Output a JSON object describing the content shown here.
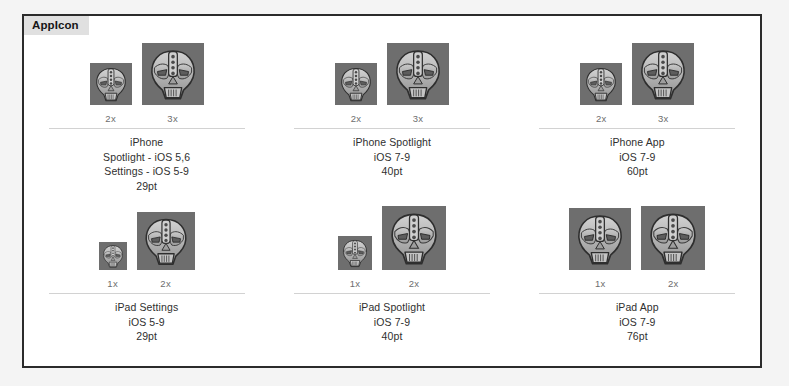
{
  "panel": {
    "tab_label": "AppIcon",
    "border_color": "#2b2b2b",
    "tab_bg": "#e0e0e0",
    "background": "#ffffff"
  },
  "icon": {
    "name": "app-icon-mask-artwork",
    "background_color": "#6e6e6e",
    "fill_color": "#b5b5b5",
    "outline_color": "#2e2e2e"
  },
  "groups": [
    {
      "id": "iphone-spotlight-settings",
      "title": "iPhone",
      "line2": "Spotlight - iOS 5,6",
      "line3": "Settings - iOS 5-9",
      "size": "29pt",
      "slots": [
        {
          "scale": "2x",
          "px": 42
        },
        {
          "scale": "3x",
          "px": 62
        }
      ]
    },
    {
      "id": "iphone-spotlight",
      "title": "iPhone Spotlight",
      "line2": "iOS 7-9",
      "line3": "",
      "size": "40pt",
      "slots": [
        {
          "scale": "2x",
          "px": 42
        },
        {
          "scale": "3x",
          "px": 62
        }
      ]
    },
    {
      "id": "iphone-app",
      "title": "iPhone App",
      "line2": "iOS 7-9",
      "line3": "",
      "size": "60pt",
      "slots": [
        {
          "scale": "2x",
          "px": 42
        },
        {
          "scale": "3x",
          "px": 62
        }
      ]
    },
    {
      "id": "ipad-settings",
      "title": "iPad Settings",
      "line2": "iOS 5-9",
      "line3": "",
      "size": "29pt",
      "slots": [
        {
          "scale": "1x",
          "px": 28
        },
        {
          "scale": "2x",
          "px": 58
        }
      ]
    },
    {
      "id": "ipad-spotlight",
      "title": "iPad Spotlight",
      "line2": "iOS 7-9",
      "line3": "",
      "size": "40pt",
      "slots": [
        {
          "scale": "1x",
          "px": 34
        },
        {
          "scale": "2x",
          "px": 64
        }
      ]
    },
    {
      "id": "ipad-app",
      "title": "iPad App",
      "line2": "iOS 7-9",
      "line3": "",
      "size": "76pt",
      "slots": [
        {
          "scale": "1x",
          "px": 62
        },
        {
          "scale": "2x",
          "px": 64
        }
      ]
    }
  ]
}
